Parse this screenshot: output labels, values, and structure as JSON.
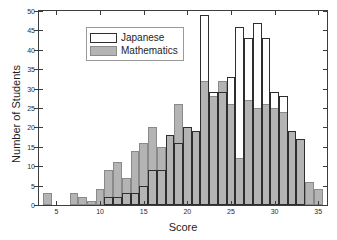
{
  "chart_data": {
    "type": "bar",
    "title": "",
    "subtitle": "",
    "xlabel": "Score",
    "ylabel": "Number of Students",
    "xlim": [
      3,
      36
    ],
    "ylim": [
      0,
      50
    ],
    "xticks": [
      5,
      10,
      15,
      20,
      25,
      30,
      35
    ],
    "yticks": [
      0,
      5,
      10,
      15,
      20,
      25,
      30,
      35,
      40,
      45,
      50
    ],
    "grid": false,
    "legend_position": "upper left",
    "bin_width": 1,
    "categories": [
      4,
      5,
      6,
      7,
      8,
      9,
      10,
      11,
      12,
      13,
      14,
      15,
      16,
      17,
      18,
      19,
      20,
      21,
      22,
      23,
      24,
      25,
      26,
      27,
      28,
      29,
      30,
      31,
      32,
      33,
      34,
      35
    ],
    "series": [
      {
        "name": "Japanese",
        "style": "outline",
        "color": "#2e2e2e",
        "values": [
          0,
          0,
          0,
          0,
          0,
          0,
          0,
          2,
          2,
          3,
          3,
          5,
          9,
          9,
          18,
          16,
          20,
          19,
          49,
          29,
          29,
          33,
          46,
          43,
          47,
          43,
          29,
          28,
          19,
          17,
          0,
          0
        ]
      },
      {
        "name": "Mathematics",
        "style": "filled",
        "color": "#b4b4b4",
        "values": [
          3,
          0,
          0,
          3,
          2,
          1,
          4,
          9,
          11,
          7,
          14,
          16,
          20,
          15,
          18,
          26,
          20,
          19,
          32,
          28,
          32,
          26,
          12,
          27,
          25,
          26,
          25,
          24,
          19,
          17,
          6,
          4
        ]
      }
    ]
  },
  "legend": {
    "items": [
      {
        "label": "Japanese",
        "swatch": "outline-swatch"
      },
      {
        "label": "Mathematics",
        "swatch": "filled-swatch"
      }
    ]
  },
  "axes": {
    "x_title": "Score",
    "y_title": "Number of Students",
    "x_tick_labels": [
      "5",
      "10",
      "15",
      "20",
      "25",
      "30",
      "35"
    ],
    "y_tick_labels": [
      "0",
      "5",
      "10",
      "15",
      "20",
      "25",
      "30",
      "35",
      "40",
      "45",
      "50"
    ]
  }
}
